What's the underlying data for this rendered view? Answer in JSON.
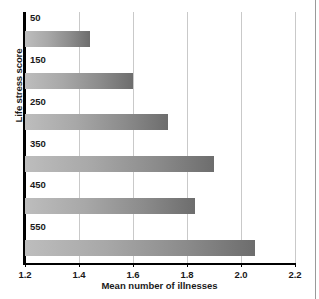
{
  "chart_data": {
    "type": "bar",
    "orientation": "horizontal",
    "title": "",
    "xlabel": "Mean number of illnesses",
    "ylabel": "Life stress score",
    "categories": [
      "50",
      "150",
      "250",
      "350",
      "450",
      "550"
    ],
    "values": [
      1.44,
      1.6,
      1.73,
      1.9,
      1.83,
      2.05
    ],
    "xlim": [
      1.2,
      2.2
    ],
    "xticks": [
      "1.2",
      "1.4",
      "1.6",
      "1.8",
      "2.0",
      "2.2"
    ],
    "xtick_values": [
      1.2,
      1.4,
      1.6,
      1.8,
      2.0,
      2.2
    ],
    "grid": "vertical",
    "legend": "none",
    "bar_fill": "#a0a0a0",
    "bar_gradient_from": "#bdbdbd",
    "bar_gradient_to": "#6d6d6d",
    "axis_color": "#000000",
    "grid_color": "#c9c9c9",
    "text_color": "#1a1a1a",
    "background": "#ffffff"
  }
}
